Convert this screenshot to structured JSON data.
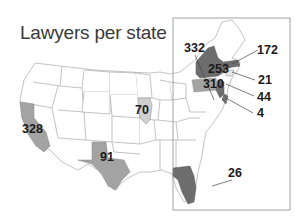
{
  "title": "Lawyers per state",
  "colors": {
    "background": "#ffffff",
    "state_fill": "#ffffff",
    "state_border": "#9a9a9a",
    "medium_gray": "#a3a3a3",
    "light_gray": "#cfcfcf",
    "dark_gray": "#6d6d6d",
    "inset_border": "#8a8a8a",
    "text": "#1a1a1a"
  },
  "labels": [
    {
      "id": "california",
      "value": "328"
    },
    {
      "id": "texas",
      "value": "91"
    },
    {
      "id": "illinois",
      "value": "70"
    },
    {
      "id": "florida",
      "value": "26"
    },
    {
      "id": "pennsylvania",
      "value": "332"
    },
    {
      "id": "new-york",
      "value": "253"
    },
    {
      "id": "massachusetts",
      "value": "172"
    },
    {
      "id": "connecticut",
      "value": "21"
    },
    {
      "id": "new-jersey",
      "value": "310"
    },
    {
      "id": "delaware",
      "value": "44"
    },
    {
      "id": "maryland",
      "value": "4"
    }
  ]
}
